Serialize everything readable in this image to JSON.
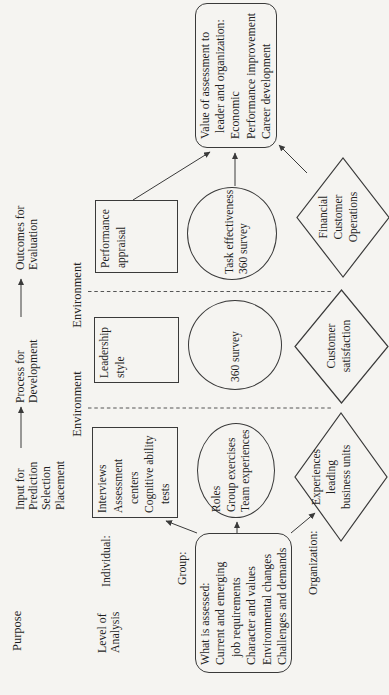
{
  "figure": {
    "background": "#f5f4f1",
    "ink": "#1f1f1f",
    "stroke": "#3a3a3a"
  },
  "header": {
    "purpose": "Purpose",
    "input": {
      "lines": [
        "Input for",
        "Prediction",
        "Selection",
        "Placement"
      ]
    },
    "process": {
      "lines": [
        "Process for",
        "Development"
      ]
    },
    "outcomes": {
      "lines": [
        "Outcomes for",
        "Evaluation"
      ]
    }
  },
  "rows": {
    "level_of_analysis": {
      "lines": [
        "Level of",
        "Analysis"
      ]
    },
    "individual": "Individual:",
    "group": "Group:",
    "organization": "Organization:"
  },
  "environment": {
    "left": "Environment",
    "right": "Environment"
  },
  "individual_row": {
    "interviews": {
      "lines": [
        "Interviews",
        "Assessment",
        "centers",
        "Cognitive ability",
        "tests"
      ]
    },
    "leadership": {
      "lines": [
        "Leadership",
        "style"
      ]
    },
    "performance": {
      "lines": [
        "Performance",
        "appraisal"
      ]
    }
  },
  "group_row": {
    "roles": {
      "lines": [
        "Roles",
        "Group exercises",
        "Team experiences"
      ]
    },
    "survey360": {
      "lines": [
        "360 survey"
      ]
    },
    "task": {
      "lines": [
        "Task effectiveness",
        "360 survey"
      ]
    }
  },
  "organization_row": {
    "experiences": {
      "lines": [
        "Experiences",
        "leading",
        "business units"
      ]
    },
    "customer": {
      "lines": [
        "Customer",
        "satisfaction"
      ]
    },
    "financial": {
      "lines": [
        "Financial",
        "Customer",
        "Operations"
      ]
    }
  },
  "callouts": {
    "what_assessed": {
      "lines": [
        "What is assessed:",
        "Current and emerging",
        "job requirements",
        "Character and values",
        "Environmental changes",
        "Challenges and demands"
      ]
    },
    "value": {
      "lines": [
        "Value of assessment to",
        "leader and organization:",
        "Economic",
        "Performance improvement",
        "Career development"
      ]
    }
  }
}
